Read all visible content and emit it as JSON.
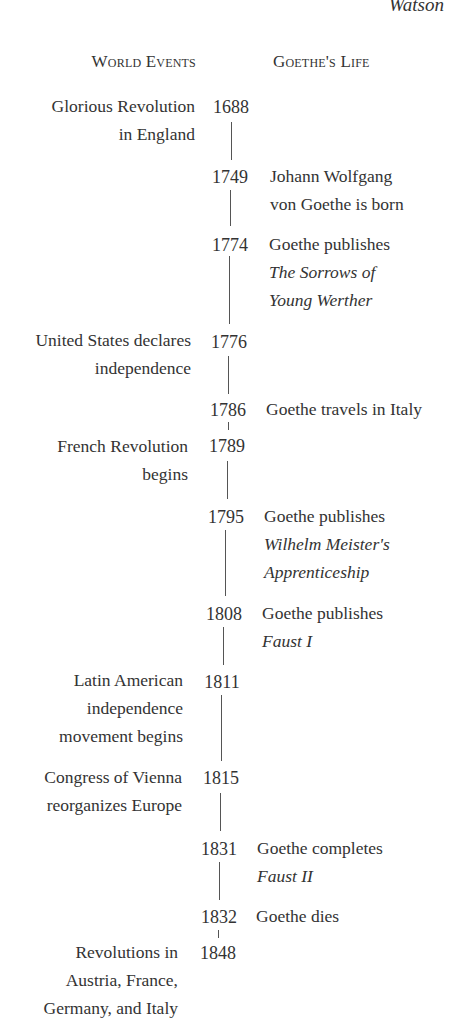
{
  "running_head": "Watson",
  "headers": {
    "world_events": "World Events",
    "goethes_life": "Goethe's Life"
  },
  "entries": [
    {
      "year": "1688",
      "world": [
        "Glorious Revolution",
        "in England"
      ],
      "life": [],
      "life_titles": []
    },
    {
      "year": "1749",
      "world": [],
      "life": [
        "Johann Wolfgang",
        "von Goethe is born"
      ],
      "life_titles": []
    },
    {
      "year": "1774",
      "world": [],
      "life": [
        "Goethe publishes"
      ],
      "life_titles": [
        "The Sorrows of",
        "Young Werther"
      ]
    },
    {
      "year": "1776",
      "world": [
        "United States declares",
        "independence"
      ],
      "life": [],
      "life_titles": []
    },
    {
      "year": "1786",
      "world": [],
      "life": [
        "Goethe travels in Italy"
      ],
      "life_titles": []
    },
    {
      "year": "1789",
      "world": [
        "French Revolution",
        "begins"
      ],
      "life": [],
      "life_titles": []
    },
    {
      "year": "1795",
      "world": [],
      "life": [
        "Goethe publishes"
      ],
      "life_titles": [
        "Wilhelm Meister's",
        "Apprenticeship"
      ]
    },
    {
      "year": "1808",
      "world": [],
      "life": [
        "Goethe publishes"
      ],
      "life_titles": [
        "Faust I"
      ]
    },
    {
      "year": "1811",
      "world": [
        "Latin American",
        "independence",
        "movement begins"
      ],
      "life": [],
      "life_titles": []
    },
    {
      "year": "1815",
      "world": [
        "Congress of Vienna",
        "reorganizes Europe"
      ],
      "life": [],
      "life_titles": []
    },
    {
      "year": "1831",
      "world": [],
      "life": [
        "Goethe completes"
      ],
      "life_titles": [
        "Faust II"
      ]
    },
    {
      "year": "1832",
      "world": [],
      "life": [
        "Goethe dies"
      ],
      "life_titles": []
    },
    {
      "year": "1848",
      "world": [
        "Revolutions in",
        "Austria, France,",
        "Germany, and Italy"
      ],
      "life": [],
      "life_titles": []
    }
  ]
}
